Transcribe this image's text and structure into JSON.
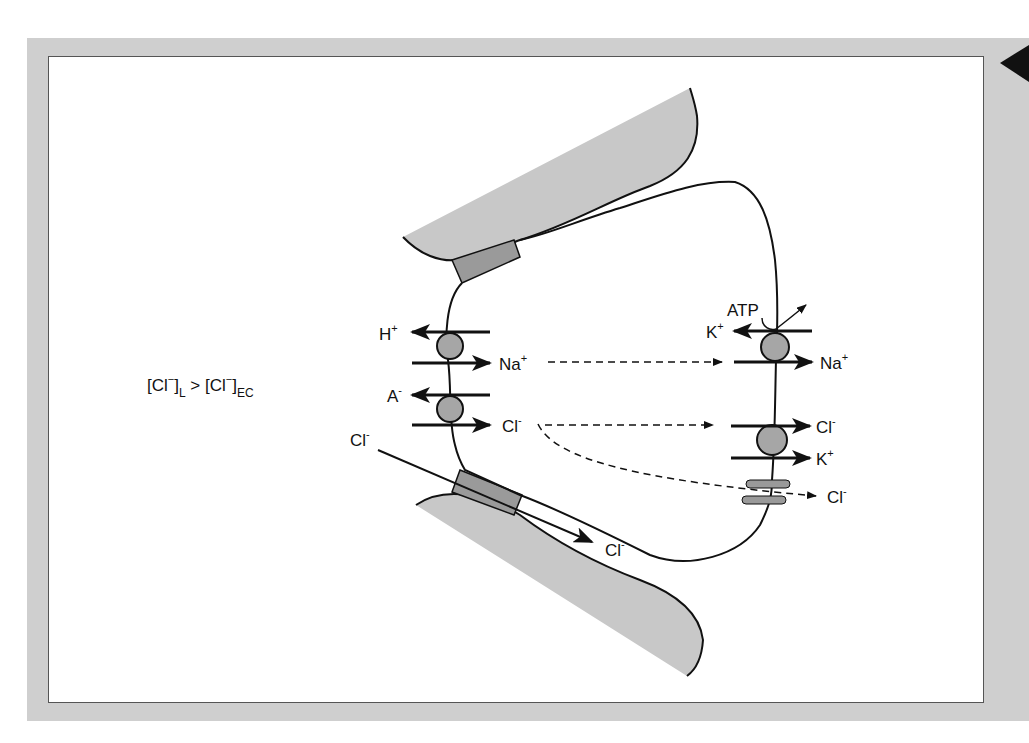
{
  "diagram": {
    "type": "cell-transport-diagram",
    "condition_label": {
      "prefix": "[Cl",
      "sup1": "−",
      "mid1": "]",
      "sub1": "L",
      "op": " > [Cl",
      "sup2": "−",
      "mid2": "]",
      "sub2": "EC"
    },
    "apical_transporters": [
      {
        "left_ion": "H",
        "left_charge": "+",
        "right_ion": "Na",
        "right_charge": "+"
      },
      {
        "left_ion": "A",
        "left_charge": "-",
        "right_ion": "Cl",
        "right_charge": "-"
      }
    ],
    "paracellular": {
      "in_ion": "Cl",
      "in_charge": "-",
      "out_ion": "Cl",
      "out_charge": "-"
    },
    "basolateral": {
      "pump": {
        "energy": "ATP",
        "out_ion": "K",
        "out_charge": "+",
        "in_ion": "Na",
        "in_charge": "+"
      },
      "cotransporter": {
        "ion1": "Cl",
        "ion1_charge": "-",
        "ion2": "K",
        "ion2_charge": "+"
      },
      "channel": {
        "ion": "Cl",
        "charge": "-"
      }
    },
    "colors": {
      "frame": "#cfcfcf",
      "tissue": "#c8c8c8",
      "junction": "#9a9a9a",
      "transporter": "#a6a6a6",
      "line": "#111111"
    }
  }
}
